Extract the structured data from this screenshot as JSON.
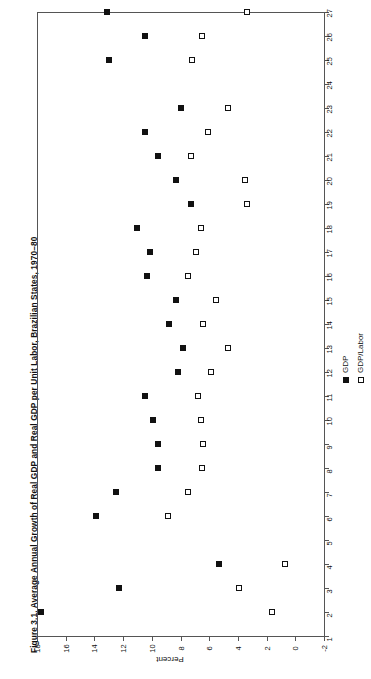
{
  "chart_data": {
    "type": "scatter",
    "title": "Figure 3.1.  Average Annual Growth of Real GDP and Real GDP per Unit Labor, Brazilian States, 1970–80",
    "orientation": "horizontal",
    "xlabel": "Percent",
    "ylabel": "",
    "xlim": [
      -2,
      18
    ],
    "xticks": [
      18,
      16,
      14,
      12,
      10,
      8,
      6,
      4,
      2,
      0,
      -2
    ],
    "xtick_labels": [
      "18",
      "16",
      "14",
      "12",
      "10",
      "8",
      "6",
      "4",
      "2",
      "0",
      "-2"
    ],
    "categories": [
      "1",
      "2",
      "3",
      "4",
      "5",
      "6",
      "7",
      "8",
      "9",
      "10",
      "11",
      "12",
      "13",
      "14",
      "15",
      "16",
      "17",
      "18",
      "19",
      "20",
      "21",
      "22",
      "23",
      "24",
      "25",
      "26",
      "27"
    ],
    "grid": false,
    "legend_position": "bottom-right",
    "series": [
      {
        "name": "GDP",
        "marker": "filled-square",
        "color": "#111111",
        "values": [
          null,
          17.7,
          12.3,
          5.3,
          null,
          13.9,
          12.5,
          9.6,
          9.6,
          9.9,
          10.5,
          8.2,
          7.8,
          8.8,
          8.3,
          10.3,
          10.1,
          11.0,
          7.3,
          8.3,
          9.6,
          10.5,
          8.0,
          null,
          13.0,
          10.5,
          13.1
        ],
        "label": "GDP"
      },
      {
        "name": "GDP/Labor",
        "marker": "open-square",
        "color": "#ffffff",
        "values": [
          null,
          1.6,
          3.9,
          0.7,
          null,
          8.9,
          7.5,
          6.5,
          6.4,
          6.6,
          6.8,
          5.9,
          4.7,
          6.4,
          5.5,
          7.5,
          6.9,
          6.6,
          3.4,
          3.5,
          7.3,
          6.1,
          4.7,
          null,
          7.2,
          6.5,
          3.4
        ],
        "label": "GDP/Labor"
      }
    ]
  },
  "legend": {
    "entries": [
      {
        "label": "GDP",
        "marker": "filled-square"
      },
      {
        "label": "GDP/Labor",
        "marker": "open-square"
      }
    ]
  }
}
